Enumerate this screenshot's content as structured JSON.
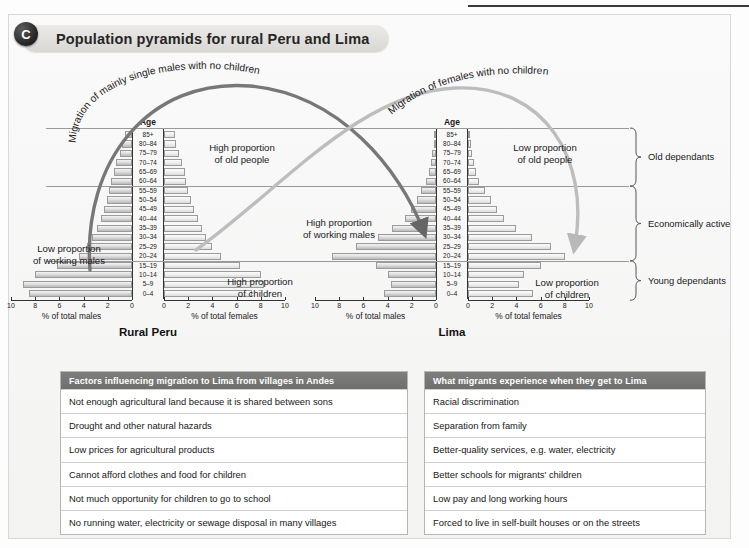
{
  "figure": {
    "badge": "C",
    "title": "Population pyramids for rural Peru and Lima"
  },
  "annotations": {
    "curve_left": "Migration of mainly single males with no children",
    "curve_right": "Migration of females with no children",
    "left_low_working": "Low proportion\nof working males",
    "left_high_old": "High proportion\nof old people",
    "left_high_children": "High proportion\nof children",
    "right_high_working": "High proportion\nof working males",
    "right_low_old": "Low proportion\nof old people",
    "right_low_children": "Low proportion\nof children"
  },
  "brackets": [
    {
      "label": "Old dependants"
    },
    {
      "label": "Economically active"
    },
    {
      "label": "Young dependants"
    }
  ],
  "axis": {
    "age_header": "Age",
    "males_caption": "% of total males",
    "females_caption": "% of total females",
    "ticks": [
      "10",
      "8",
      "6",
      "4",
      "2",
      "0"
    ],
    "ticks_right": [
      "0",
      "2",
      "4",
      "6",
      "8",
      "10"
    ]
  },
  "chart_data": [
    {
      "type": "bar",
      "title": "Rural Peru",
      "subtype": "population-pyramid",
      "xlabel_left": "% of total males",
      "xlabel_right": "% of total females",
      "ylabel": "Age",
      "xlim": [
        0,
        10
      ],
      "grid": false,
      "categories": [
        "85+",
        "80–84",
        "75–79",
        "70–74",
        "65–69",
        "60–64",
        "55–59",
        "50–54",
        "45–49",
        "40–44",
        "35–39",
        "30–34",
        "25–29",
        "20–24",
        "15–19",
        "10–14",
        "5–9",
        "0–4"
      ],
      "series": [
        {
          "name": "% of total males",
          "side": "left",
          "values": [
            0.6,
            0.8,
            1.0,
            1.3,
            1.5,
            1.7,
            1.9,
            2.1,
            2.3,
            2.6,
            2.9,
            3.3,
            3.7,
            4.4,
            6.2,
            8.0,
            9.0,
            8.5
          ]
        },
        {
          "name": "% of total females",
          "side": "right",
          "values": [
            0.9,
            1.0,
            1.2,
            1.5,
            1.7,
            1.8,
            2.0,
            2.2,
            2.5,
            2.8,
            3.1,
            3.5,
            4.0,
            4.7,
            6.3,
            8.0,
            8.3,
            7.3
          ]
        }
      ]
    },
    {
      "type": "bar",
      "title": "Lima",
      "subtype": "population-pyramid",
      "xlabel_left": "% of total males",
      "xlabel_right": "% of total females",
      "ylabel": "Age",
      "xlim": [
        0,
        10
      ],
      "grid": false,
      "categories": [
        "85+",
        "80–84",
        "75–79",
        "70–74",
        "65–69",
        "60–64",
        "55–59",
        "50–54",
        "45–49",
        "40–44",
        "35–39",
        "30–34",
        "25–29",
        "20–24",
        "15–19",
        "10–14",
        "5–9",
        "0–4"
      ],
      "series": [
        {
          "name": "% of total males",
          "side": "left",
          "values": [
            0.15,
            0.2,
            0.3,
            0.4,
            0.6,
            0.8,
            1.2,
            1.6,
            2.1,
            2.6,
            3.6,
            4.8,
            6.6,
            8.6,
            5.0,
            4.0,
            3.7,
            4.3
          ]
        },
        {
          "name": "% of total females",
          "side": "right",
          "values": [
            0.15,
            0.25,
            0.35,
            0.5,
            0.7,
            0.9,
            1.4,
            1.9,
            2.4,
            3.0,
            4.0,
            5.3,
            6.9,
            8.0,
            6.0,
            4.6,
            4.2,
            5.4
          ]
        }
      ]
    }
  ],
  "tables": [
    {
      "header": "Factors influencing migration to Lima from villages in Andes",
      "rows": [
        "Not enough agricultural land because it is shared between sons",
        "Drought and other natural hazards",
        "Low prices for agricultural products",
        "Cannot afford clothes and food for children",
        "Not much opportunity for children to go to school",
        "No running water, electricity or sewage disposal in many villages"
      ]
    },
    {
      "header": "What migrants experience when they get to Lima",
      "rows": [
        "Racial discrimination",
        "Separation from family",
        "Better-quality services, e.g. water, electricity",
        "Better schools for migrants' children",
        "Low pay and long working hours",
        "Forced to live in self-built houses or on the streets"
      ]
    }
  ]
}
